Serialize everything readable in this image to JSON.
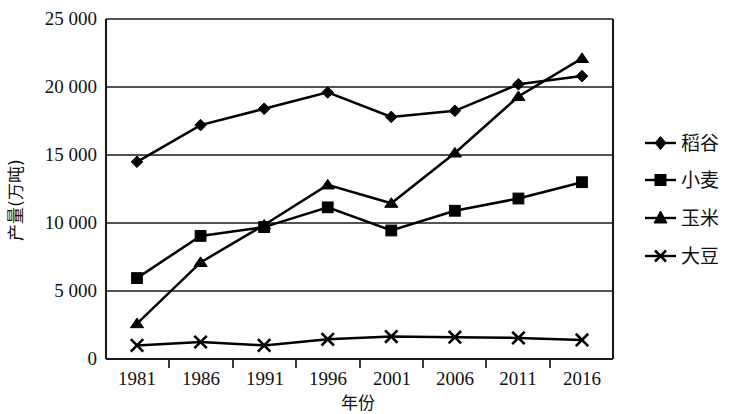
{
  "chart_data": {
    "type": "line",
    "title": "",
    "xlabel": "年份",
    "ylabel": "产量(万吨)",
    "categories": [
      "1981",
      "1986",
      "1991",
      "1996",
      "2001",
      "2006",
      "2011",
      "2016"
    ],
    "ylim": [
      0,
      25000
    ],
    "yticks": [
      0,
      5000,
      10000,
      15000,
      20000,
      25000
    ],
    "ytick_labels": [
      "0",
      "5 000",
      "10 000",
      "15 000",
      "20 000",
      "25 000"
    ],
    "grid": true,
    "legend_position": "right",
    "series": [
      {
        "name": "稻谷",
        "marker": "diamond",
        "values": [
          14500,
          17200,
          18400,
          19600,
          17800,
          18250,
          20200,
          20800
        ]
      },
      {
        "name": "小麦",
        "marker": "square",
        "values": [
          5950,
          9050,
          9700,
          11150,
          9450,
          10900,
          11800,
          13000
        ]
      },
      {
        "name": "玉米",
        "marker": "triangle",
        "values": [
          2600,
          7100,
          9850,
          12800,
          11450,
          15150,
          19300,
          22100
        ]
      },
      {
        "name": "大豆",
        "marker": "cross",
        "values": [
          1000,
          1250,
          1000,
          1450,
          1650,
          1600,
          1550,
          1400
        ]
      }
    ]
  },
  "legend": {
    "items": [
      {
        "label": "稻谷",
        "marker": "diamond"
      },
      {
        "label": "小麦",
        "marker": "square"
      },
      {
        "label": "玉米",
        "marker": "triangle"
      },
      {
        "label": "大豆",
        "marker": "cross"
      }
    ]
  },
  "axes": {
    "y_title": "产量(万吨)",
    "x_title": "年份"
  }
}
